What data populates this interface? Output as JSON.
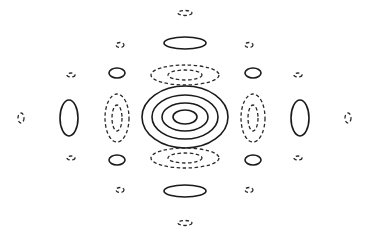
{
  "diagram": {
    "type": "contour-plot",
    "colors": {
      "background": "#ffffff",
      "line": "#1a1a1a"
    },
    "center": {
      "cx": 185,
      "cy": 117
    },
    "contours": [
      {
        "id": "center-ring-1",
        "style": "solid",
        "cx": 185,
        "cy": 117,
        "rx": 43,
        "ry": 31
      },
      {
        "id": "center-ring-2",
        "style": "solid",
        "cx": 185,
        "cy": 117,
        "rx": 33,
        "ry": 22
      },
      {
        "id": "center-ring-3",
        "style": "solid",
        "cx": 185,
        "cy": 117,
        "rx": 23,
        "ry": 14
      },
      {
        "id": "center-ring-4",
        "style": "solid",
        "cx": 185,
        "cy": 117,
        "rx": 12,
        "ry": 7
      },
      {
        "id": "top-neg-outer",
        "style": "dashed",
        "cx": 185,
        "cy": 75,
        "rx": 34,
        "ry": 10
      },
      {
        "id": "top-neg-inner",
        "style": "dashed",
        "cx": 185,
        "cy": 75,
        "rx": 17,
        "ry": 5
      },
      {
        "id": "bottom-neg-outer",
        "style": "dashed",
        "cx": 185,
        "cy": 158,
        "rx": 34,
        "ry": 10
      },
      {
        "id": "bottom-neg-inner",
        "style": "dashed",
        "cx": 185,
        "cy": 158,
        "rx": 17,
        "ry": 5
      },
      {
        "id": "top-pos",
        "style": "solid",
        "cx": 185,
        "cy": 43,
        "rx": 21,
        "ry": 6
      },
      {
        "id": "bottom-pos",
        "style": "solid",
        "cx": 185,
        "cy": 191,
        "rx": 21,
        "ry": 6
      },
      {
        "id": "top-tiny-neg",
        "style": "dashed",
        "cx": 185,
        "cy": 13,
        "rx": 7,
        "ry": 2.5
      },
      {
        "id": "bottom-tiny-neg",
        "style": "dashed",
        "cx": 185,
        "cy": 223,
        "rx": 7,
        "ry": 2.5
      },
      {
        "id": "left-neg-outer",
        "style": "dashed",
        "cx": 117,
        "cy": 118,
        "rx": 12,
        "ry": 24
      },
      {
        "id": "left-neg-inner",
        "style": "dashed",
        "cx": 117,
        "cy": 118,
        "rx": 5,
        "ry": 13
      },
      {
        "id": "right-neg-outer",
        "style": "dashed",
        "cx": 253,
        "cy": 118,
        "rx": 12,
        "ry": 24
      },
      {
        "id": "right-neg-inner",
        "style": "dashed",
        "cx": 253,
        "cy": 118,
        "rx": 5,
        "ry": 13
      },
      {
        "id": "left-pos",
        "style": "solid",
        "cx": 69,
        "cy": 118,
        "rx": 9,
        "ry": 18
      },
      {
        "id": "right-pos",
        "style": "solid",
        "cx": 300,
        "cy": 118,
        "rx": 9,
        "ry": 18
      },
      {
        "id": "far-left-neg",
        "style": "dashed",
        "cx": 21,
        "cy": 118,
        "rx": 3,
        "ry": 5
      },
      {
        "id": "far-right-neg",
        "style": "dashed",
        "cx": 348,
        "cy": 118,
        "rx": 3,
        "ry": 5
      },
      {
        "id": "upper-left-pos",
        "style": "solid",
        "cx": 117,
        "cy": 73,
        "rx": 8,
        "ry": 5
      },
      {
        "id": "upper-right-pos",
        "style": "solid",
        "cx": 253,
        "cy": 73,
        "rx": 8,
        "ry": 5
      },
      {
        "id": "lower-left-pos",
        "style": "solid",
        "cx": 117,
        "cy": 160,
        "rx": 8,
        "ry": 5
      },
      {
        "id": "lower-right-pos",
        "style": "solid",
        "cx": 253,
        "cy": 160,
        "rx": 8,
        "ry": 5
      },
      {
        "id": "upper-left-tiny-neg",
        "style": "dashed",
        "cx": 120,
        "cy": 45,
        "rx": 4,
        "ry": 2.5
      },
      {
        "id": "upper-right-tiny-neg",
        "style": "dashed",
        "cx": 249,
        "cy": 45,
        "rx": 4,
        "ry": 2.5
      },
      {
        "id": "lower-left-tiny-neg",
        "style": "dashed",
        "cx": 120,
        "cy": 190,
        "rx": 4,
        "ry": 2.5
      },
      {
        "id": "lower-right-tiny-neg",
        "style": "dashed",
        "cx": 249,
        "cy": 190,
        "rx": 4,
        "ry": 2.5
      },
      {
        "id": "mid-left-upper-tiny-neg",
        "style": "dashed",
        "cx": 71,
        "cy": 75,
        "rx": 4,
        "ry": 2
      },
      {
        "id": "mid-right-upper-tiny-neg",
        "style": "dashed",
        "cx": 298,
        "cy": 75,
        "rx": 4,
        "ry": 2
      },
      {
        "id": "mid-left-lower-tiny-neg",
        "style": "dashed",
        "cx": 71,
        "cy": 158,
        "rx": 4,
        "ry": 2
      },
      {
        "id": "mid-right-lower-tiny-neg",
        "style": "dashed",
        "cx": 298,
        "cy": 158,
        "rx": 4,
        "ry": 2
      }
    ]
  }
}
